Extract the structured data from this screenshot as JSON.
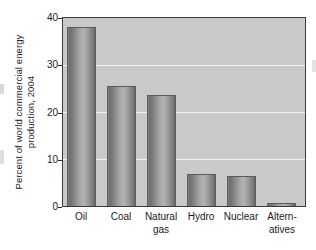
{
  "chart_data": {
    "type": "bar",
    "title": "",
    "xlabel": "",
    "ylabel_lines": [
      "Percent of world commercial energy",
      "production, 2004"
    ],
    "ylabel": "Percent of world commercial energy production, 2004",
    "categories": [
      "Oil",
      "Coal",
      "Natural gas",
      "Hydro",
      "Nuclear",
      "Alternatives"
    ],
    "category_lines": [
      [
        "Oil",
        ""
      ],
      [
        "Coal",
        ""
      ],
      [
        "Natural",
        "gas"
      ],
      [
        "Hydro",
        ""
      ],
      [
        "Nuclear",
        ""
      ],
      [
        "Altern-",
        "atives"
      ]
    ],
    "values": [
      38.0,
      25.6,
      23.6,
      6.9,
      6.4,
      0.6
    ],
    "ylim": [
      0,
      40
    ],
    "yticks": [
      0,
      10,
      20,
      30,
      40
    ],
    "ytick_labels": [
      "0",
      "10",
      "20",
      "30",
      "40"
    ],
    "grid": true,
    "grid_color": "#f2f2f2",
    "legend": "none",
    "plot_background": "#c9c9c9",
    "bar_color": "#8e8e8e",
    "axis_color": "#3b3b3b",
    "figure_background": "#ffffff"
  }
}
